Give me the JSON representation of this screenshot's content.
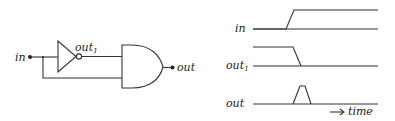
{
  "circuit": {
    "input_label": "in",
    "inverter_output_label": "out",
    "inverter_output_subscript": "1",
    "output_label": "out",
    "gates": [
      "inverter",
      "and-gate"
    ]
  },
  "timing": {
    "signals": [
      {
        "label": "in",
        "subscript": "",
        "waveform": "low-to-high"
      },
      {
        "label": "out",
        "subscript": "1",
        "waveform": "high-to-low (delayed)"
      },
      {
        "label": "out",
        "subscript": "",
        "waveform": "glitch pulse"
      }
    ],
    "axis_label": "time",
    "axis_arrow": "→"
  },
  "colors": {
    "line": "#333333",
    "text": "#222222",
    "background": "#ffffff"
  }
}
